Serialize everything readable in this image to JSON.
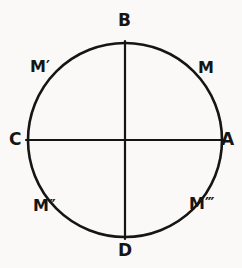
{
  "figure": {
    "type": "geometric-diagram",
    "background_color": "#faf9f7",
    "ink_color": "#151515",
    "geometry": {
      "circle": {
        "cx": 125,
        "cy": 140,
        "r": 97
      },
      "horizontal_diameter": {
        "x1": 26,
        "y1": 140,
        "x2": 224,
        "y2": 140
      },
      "vertical_diameter": {
        "x1": 125,
        "y1": 41,
        "x2": 125,
        "y2": 239
      }
    },
    "point_labels": [
      {
        "id": "B",
        "text": "B",
        "position": "top",
        "x": 125,
        "y": 41
      },
      {
        "id": "A",
        "text": "A",
        "position": "right",
        "x": 222,
        "y": 140
      },
      {
        "id": "C",
        "text": "C",
        "position": "left",
        "x": 28,
        "y": 140
      },
      {
        "id": "D",
        "text": "D",
        "position": "bottom",
        "x": 125,
        "y": 239
      }
    ],
    "arc_labels": [
      {
        "id": "M",
        "base": "M",
        "primes": "",
        "quadrant": "upper-right",
        "x": 205,
        "y": 67
      },
      {
        "id": "Mp",
        "base": "M",
        "primes": "′",
        "quadrant": "upper-left",
        "x": 45,
        "y": 67
      },
      {
        "id": "Mpp",
        "base": "M",
        "primes": "″",
        "quadrant": "lower-left",
        "x": 45,
        "y": 206
      },
      {
        "id": "Mppp",
        "base": "M",
        "primes": "‴",
        "quadrant": "lower-right",
        "x": 205,
        "y": 205
      }
    ]
  }
}
